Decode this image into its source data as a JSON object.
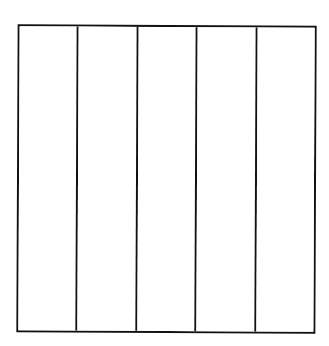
{
  "diagram": {
    "type": "rectangle-divided-into-equal-columns",
    "shape": "rectangle",
    "columns": 5,
    "rows": 1,
    "stroke_color": "#111111",
    "fill_color": "#ffffff",
    "background_color": "#ffffff",
    "parts": [
      {
        "index": 1,
        "label": ""
      },
      {
        "index": 2,
        "label": ""
      },
      {
        "index": 3,
        "label": ""
      },
      {
        "index": 4,
        "label": ""
      },
      {
        "index": 5,
        "label": ""
      }
    ]
  }
}
